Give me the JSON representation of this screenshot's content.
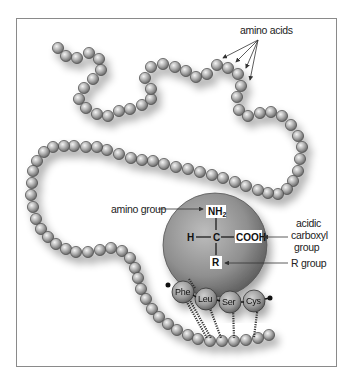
{
  "figure": {
    "colors": {
      "bead_light": "#e8e8e8",
      "bead_dark": "#6e6e6e",
      "sphere_light": "#b8b8b8",
      "sphere_dark": "#5a5a5a",
      "frame": "#8a8a8a",
      "text": "#222222"
    }
  },
  "labels": {
    "amino_acids": "amino acids",
    "amino_group": "amino group",
    "acidic_carboxyl_line1": "acidic",
    "acidic_carboxyl_line2": "carboxyl",
    "acidic_carboxyl_line3": "group",
    "r_group": "R group"
  },
  "structure": {
    "nh2": "NH",
    "nh2_sub": "2",
    "carbon": "C",
    "hydrogen": "H",
    "cooh": "COOH",
    "r": "R"
  },
  "residues": [
    {
      "label": "Phe"
    },
    {
      "label": "Leu"
    },
    {
      "label": "Ser"
    },
    {
      "label": "Cys"
    }
  ]
}
